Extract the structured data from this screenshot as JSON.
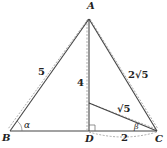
{
  "diagram": {
    "points": {
      "A": {
        "label": "A",
        "x": 89,
        "y": 19
      },
      "B": {
        "label": "B",
        "x": 10,
        "y": 131
      },
      "C": {
        "label": "C",
        "x": 157,
        "y": 131
      },
      "D": {
        "label": "D",
        "x": 89,
        "y": 131
      },
      "E": {
        "label": "",
        "x": 89,
        "y": 103
      }
    },
    "segments": [
      {
        "from": "A",
        "to": "B",
        "length_label": "5",
        "style": "solid"
      },
      {
        "from": "A",
        "to": "C",
        "length_label": "2√5",
        "style": "solid"
      },
      {
        "from": "A",
        "to": "D",
        "length_label": "4",
        "style": "solid"
      },
      {
        "from": "B",
        "to": "C",
        "length_label": "",
        "style": "solid"
      },
      {
        "from": "E",
        "to": "C",
        "length_label": "√5",
        "style": "solid"
      },
      {
        "from": "D",
        "to": "C",
        "length_label": "2",
        "style": "dashed-arc"
      }
    ],
    "angles": {
      "alpha": {
        "label": "α",
        "vertex": "B"
      },
      "beta": {
        "label": "β",
        "vertex": "C"
      }
    },
    "labels": {
      "A": "A",
      "B": "B",
      "C": "C",
      "D": "D",
      "AB": "5",
      "AD": "4",
      "AC": "2√5",
      "EC": "√5",
      "DC": "2",
      "alpha": "α",
      "beta": "β"
    },
    "colors": {
      "line": "#333333",
      "dashed": "#777777",
      "text": "#222222"
    }
  }
}
